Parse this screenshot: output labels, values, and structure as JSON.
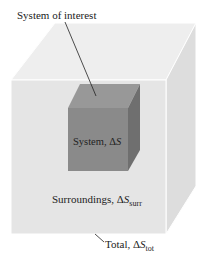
{
  "diagram": {
    "labels": {
      "system_of_interest": "System of interest",
      "system": "System, Δ",
      "system_var": "S",
      "surroundings": "Surroundings, Δ",
      "surroundings_var": "S",
      "surroundings_sub": "surr",
      "total": "Total, Δ",
      "total_var": "S",
      "total_sub": "tot"
    },
    "colors": {
      "outer_front": "#e6e6e6",
      "outer_top": "#eeeeee",
      "outer_right": "#dcdcdc",
      "outer_edge": "#ffffff",
      "inner_front": "#8a8a8a",
      "inner_top": "#9a9a9a",
      "inner_right": "#707070",
      "leader_line": "#222222"
    }
  }
}
